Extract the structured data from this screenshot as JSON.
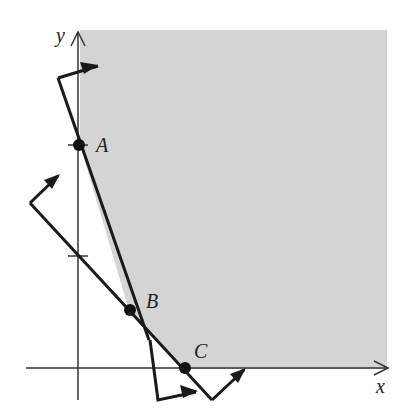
{
  "figure": {
    "axes": {
      "x_label": "x",
      "y_label": "y"
    },
    "points": [
      {
        "name": "A",
        "label": "A"
      },
      {
        "name": "B",
        "label": "B"
      },
      {
        "name": "C",
        "label": "C"
      }
    ],
    "region": {
      "description": "Shaded feasible region bounded by y-axis-side lines through A, B, C",
      "fill": "#d4d4d4"
    },
    "colors": {
      "line": "#1a1a1a",
      "shade": "#d4d4d4"
    }
  }
}
